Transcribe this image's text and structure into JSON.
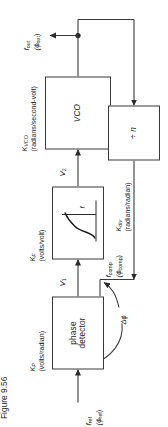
{
  "figure": {
    "caption": "Figure 9.56",
    "title_hidden": "Phase-locked loop block diagram"
  },
  "blocks": [
    {
      "id": "phase-detector",
      "label": "phase\ndetector",
      "line1": "phase",
      "line2": "detector",
      "gain_symbol": "K",
      "gain_sub": "P",
      "units": "(volts/radian)"
    },
    {
      "id": "loop-filter",
      "label": "",
      "line1": "",
      "line2": "",
      "gain_symbol": "K",
      "gain_sub": "F",
      "units": "(volts/volt)",
      "axis_label": "f"
    },
    {
      "id": "vco",
      "label": "VCO",
      "line1": "VCO",
      "line2": "",
      "gain_symbol": "K",
      "gain_sub": "VCO",
      "units": "(radians/second-volt)"
    },
    {
      "id": "divider",
      "label": "÷ n",
      "line1": "÷ n",
      "line2": "",
      "gain_symbol": "K",
      "gain_sub": "div",
      "units": "(radians/radian)"
    }
  ],
  "signals": {
    "input": {
      "name": "f",
      "sub": "ref",
      "phase": "(ϕ",
      "phase_sub": "ref",
      "phase_close": ")"
    },
    "v1": {
      "name": "V",
      "sub": "1"
    },
    "v2": {
      "name": "V",
      "sub": "2"
    },
    "output": {
      "name": "f",
      "sub": "out",
      "phase": "(ϕ",
      "phase_sub": "out",
      "phase_close": ")"
    },
    "feedback": {
      "name": "f",
      "sub": "comp",
      "phase": "(ϕ",
      "phase_sub": "comp",
      "phase_close": ")"
    },
    "phase_error": "Δϕ"
  },
  "colors": {
    "line": "#3a3a3a",
    "text": "#1d1d1d",
    "background": "#ffffff"
  }
}
